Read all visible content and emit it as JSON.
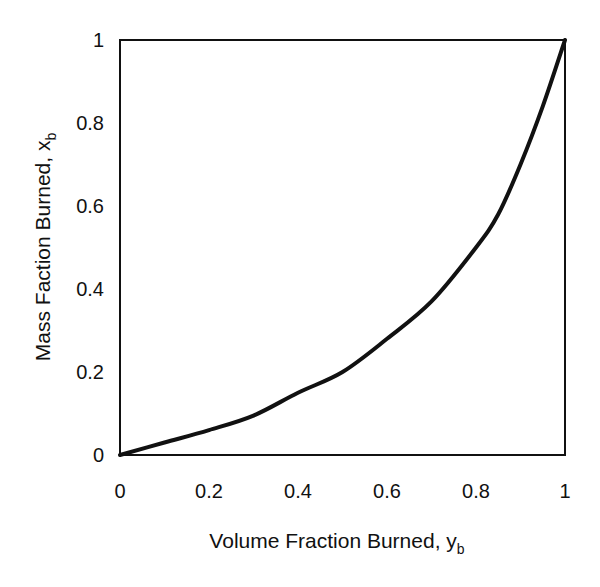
{
  "chart_data": {
    "type": "line",
    "title": "",
    "xlabel": "Volume Fraction Burned, y_b",
    "ylabel": "Mass Faction Burned, x_b",
    "xlabel_main": "Volume Fraction Burned, y",
    "xlabel_sub": "b",
    "ylabel_main": "Mass Faction Burned, x",
    "ylabel_sub": "b",
    "xlim": [
      0,
      1
    ],
    "ylim": [
      0,
      1
    ],
    "grid": false,
    "legend": null,
    "x_ticks": [
      "0",
      "0.2",
      "0.4",
      "0.6",
      "0.8",
      "1"
    ],
    "y_ticks": [
      "0",
      "0.2",
      "0.4",
      "0.6",
      "0.8",
      "1"
    ],
    "series": [
      {
        "name": "x_b vs y_b",
        "color": "#111111",
        "x": [
          0,
          0.1,
          0.2,
          0.3,
          0.4,
          0.5,
          0.6,
          0.7,
          0.8,
          0.85,
          0.9,
          0.95,
          1.0
        ],
        "y": [
          0,
          0.03,
          0.06,
          0.095,
          0.15,
          0.2,
          0.28,
          0.37,
          0.5,
          0.58,
          0.7,
          0.84,
          1.0
        ]
      }
    ]
  }
}
